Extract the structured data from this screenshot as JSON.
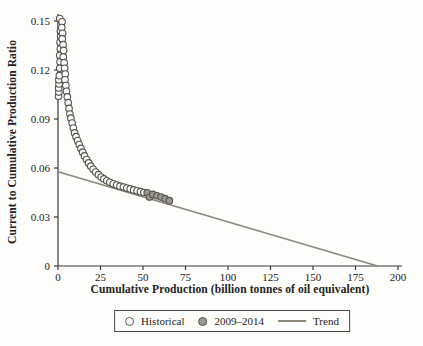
{
  "figure": {
    "background": "#fdfdfb"
  },
  "chart_data": {
    "type": "scatter",
    "title": "",
    "xlabel": "Cumulative Production (billion tonnes of oil equivalent)",
    "ylabel": "Current to Cumulative Production Ratio",
    "xlim": [
      0,
      200
    ],
    "ylim": [
      0,
      0.15
    ],
    "grid": false,
    "xticks": {
      "values": [
        0,
        25,
        50,
        75,
        100,
        125,
        150,
        175,
        200
      ],
      "labels": [
        "0",
        "25",
        "50",
        "75",
        "100",
        "125",
        "150",
        "175",
        "200"
      ]
    },
    "yticks": {
      "values": [
        0,
        0.03,
        0.06,
        0.09,
        0.12,
        0.15
      ],
      "labels": [
        "0",
        "0.03",
        "0.06",
        "0.09",
        "0.12",
        "0.15"
      ]
    },
    "legend": {
      "position": "bottom-center",
      "border": true
    },
    "series": [
      {
        "name": "Historical",
        "marker": "open-circle",
        "points": [
          [
            0.3,
            0.104
          ],
          [
            0.5,
            0.1065
          ],
          [
            0.4,
            0.109
          ],
          [
            0.6,
            0.1115
          ],
          [
            0.5,
            0.114
          ],
          [
            0.8,
            0.1165
          ],
          [
            1.0,
            0.121
          ],
          [
            1.2,
            0.125
          ],
          [
            1.0,
            0.129
          ],
          [
            1.4,
            0.133
          ],
          [
            1.2,
            0.137
          ],
          [
            1.6,
            0.1405
          ],
          [
            1.4,
            0.144
          ],
          [
            1.8,
            0.1475
          ],
          [
            1.0,
            0.1515
          ],
          [
            2.4,
            0.1495
          ],
          [
            2.2,
            0.146
          ],
          [
            2.7,
            0.1425
          ],
          [
            2.5,
            0.139
          ],
          [
            3.0,
            0.1355
          ],
          [
            3.3,
            0.132
          ],
          [
            3.1,
            0.128
          ],
          [
            3.6,
            0.1245
          ],
          [
            3.9,
            0.121
          ],
          [
            4.3,
            0.1175
          ],
          [
            4.1,
            0.114
          ],
          [
            4.6,
            0.1105
          ],
          [
            5.0,
            0.107
          ],
          [
            5.5,
            0.1035
          ],
          [
            6.0,
            0.1
          ],
          [
            6.5,
            0.0965
          ],
          [
            7.0,
            0.093
          ],
          [
            7.6,
            0.0905
          ],
          [
            8.3,
            0.0875
          ],
          [
            9.0,
            0.0845
          ],
          [
            9.8,
            0.0815
          ],
          [
            10.6,
            0.0792
          ],
          [
            11.5,
            0.0768
          ],
          [
            12.5,
            0.0744
          ],
          [
            13.5,
            0.072
          ],
          [
            14.5,
            0.0697
          ],
          [
            15.6,
            0.0674
          ],
          [
            16.8,
            0.0652
          ],
          [
            18.0,
            0.0631
          ],
          [
            19.3,
            0.0611
          ],
          [
            20.7,
            0.0592
          ],
          [
            22.2,
            0.0575
          ],
          [
            23.8,
            0.0559
          ],
          [
            25.4,
            0.0545
          ],
          [
            27.0,
            0.0533
          ],
          [
            28.7,
            0.0522
          ],
          [
            30.5,
            0.0512
          ],
          [
            32.5,
            0.0503
          ],
          [
            34.5,
            0.0496
          ],
          [
            36.5,
            0.0489
          ],
          [
            38.5,
            0.0483
          ],
          [
            40.5,
            0.0477
          ],
          [
            42.5,
            0.0472
          ],
          [
            44.5,
            0.0466
          ],
          [
            46.5,
            0.046
          ],
          [
            48.5,
            0.0455
          ],
          [
            50.5,
            0.045
          ]
        ]
      },
      {
        "name": "2009–2014",
        "marker": "filled-circle",
        "points": [
          [
            52.5,
            0.0448
          ],
          [
            53.8,
            0.0422
          ],
          [
            55.8,
            0.0438
          ],
          [
            58.2,
            0.043
          ],
          [
            60.6,
            0.0422
          ],
          [
            63.0,
            0.0412
          ],
          [
            65.5,
            0.04
          ]
        ]
      },
      {
        "name": "Trend",
        "marker": "line",
        "points": [
          [
            0,
            0.0577
          ],
          [
            188,
            0
          ]
        ]
      }
    ],
    "colors": {
      "marker_outline": "#55534f",
      "open_fill": "#fefefe",
      "filled_fill": "#9a9890",
      "trend_line": "#8e887a",
      "axis": "#3c3a38",
      "text": "#242220",
      "legend_border": "#4a4846"
    }
  }
}
